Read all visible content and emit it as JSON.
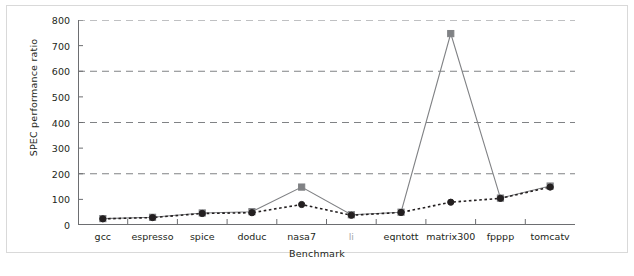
{
  "chart_data": {
    "type": "line",
    "title": "",
    "xlabel": "Benchmark",
    "ylabel": "SPEC performance ratio",
    "categories": [
      "gcc",
      "espresso",
      "spice",
      "doduc",
      "nasa7",
      "li",
      "eqntott",
      "matrix300",
      "fpppp",
      "tomcatv"
    ],
    "ylim": [
      0,
      800
    ],
    "yticks": [
      0,
      100,
      200,
      300,
      400,
      500,
      600,
      700,
      800
    ],
    "gridlines": [
      200,
      400,
      600,
      800
    ],
    "grid": "horizontal-dashed",
    "legend": "none",
    "series": [
      {
        "name": "gray-square-series",
        "color": "#808285",
        "marker": "square",
        "line": "solid",
        "values": [
          25,
          30,
          47,
          52,
          148,
          40,
          50,
          747,
          105,
          152
        ]
      },
      {
        "name": "black-circle-series",
        "color": "#231f20",
        "marker": "circle",
        "line": "dotted",
        "values": [
          24,
          29,
          45,
          48,
          80,
          38,
          49,
          89,
          104,
          148
        ]
      }
    ]
  },
  "axis": {
    "y_tick_labels": [
      "800",
      "700",
      "600",
      "500",
      "400",
      "300",
      "200",
      "100",
      "0"
    ],
    "x_tick_labels": [
      "gcc",
      "espresso",
      "spice",
      "doduc",
      "nasa7",
      "li",
      "eqntott",
      "matrix300",
      "fpppp",
      "tomcatv"
    ],
    "ylabel_text": "SPEC performance ratio",
    "xlabel_text": "Benchmark"
  },
  "colors": {
    "gray_series": "#808285",
    "black_series": "#231f20",
    "gridline": "#808285",
    "axis": "#6d6e71",
    "dim_label": "#a7a9ac",
    "background": "#ffffff"
  }
}
